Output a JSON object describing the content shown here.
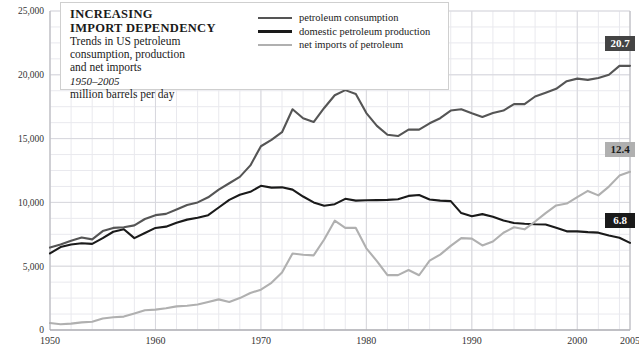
{
  "title": {
    "line1": "INCREASING",
    "line2": "IMPORT DEPENDENCY",
    "sub1": "Trends in US petroleum",
    "sub2": "consumption, production",
    "sub3": "and net imports",
    "period": "1950–2005",
    "units": "million barrels per day"
  },
  "legend": [
    {
      "label": "petroleum consumption",
      "color": "#555555"
    },
    {
      "label": "domestic petroleum production",
      "color": "#1a1a1a"
    },
    {
      "label": "net imports of petroleum",
      "color": "#b0b0b0"
    }
  ],
  "end_labels": [
    {
      "value": "20.7",
      "bg": "#444444",
      "fg": "#ffffff"
    },
    {
      "value": "12.4",
      "bg": "#b0b0b0",
      "fg": "#1a1a1a"
    },
    {
      "value": "6.8",
      "bg": "#1a1a1a",
      "fg": "#ffffff"
    }
  ],
  "axes": {
    "y_ticks": [
      "0",
      "5,000",
      "10,000",
      "15,000",
      "20,000",
      "25,000"
    ],
    "x_ticks": [
      "1950",
      "1960",
      "1970",
      "1980",
      "1990",
      "2000",
      "2005"
    ],
    "grid_color": "#d8d8dd",
    "axis_color": "#b8b8bd"
  },
  "chart_data": {
    "type": "line",
    "title": "INCREASING IMPORT DEPENDENCY",
    "subtitle": "Trends in US petroleum consumption, production and net imports, 1950–2005",
    "xlabel": "",
    "ylabel": "million barrels per day (thousands)",
    "xlim": [
      1950,
      2005
    ],
    "ylim": [
      0,
      25000
    ],
    "y_ticks": [
      0,
      5000,
      10000,
      15000,
      20000,
      25000
    ],
    "x_ticks": [
      1950,
      1960,
      1970,
      1980,
      1990,
      2000,
      2005
    ],
    "y_minor_step": 1250,
    "x_minor_step": 2,
    "grid": true,
    "legend_position": "top-right",
    "annotations": [
      {
        "text": "20.7",
        "series": "petroleum consumption",
        "x": 2005
      },
      {
        "text": "12.4",
        "series": "net imports of petroleum",
        "x": 2005
      },
      {
        "text": "6.8",
        "series": "domestic petroleum production",
        "x": 2005
      }
    ],
    "x": [
      1950,
      1951,
      1952,
      1953,
      1954,
      1955,
      1956,
      1957,
      1958,
      1959,
      1960,
      1961,
      1962,
      1963,
      1964,
      1965,
      1966,
      1967,
      1968,
      1969,
      1970,
      1971,
      1972,
      1973,
      1974,
      1975,
      1976,
      1977,
      1978,
      1979,
      1980,
      1981,
      1982,
      1983,
      1984,
      1985,
      1986,
      1987,
      1988,
      1989,
      1990,
      1991,
      1992,
      1993,
      1994,
      1995,
      1996,
      1997,
      1998,
      1999,
      2000,
      2001,
      2002,
      2003,
      2004,
      2005
    ],
    "series": [
      {
        "name": "petroleum consumption",
        "color": "#555555",
        "values": [
          6458,
          6700,
          7000,
          7250,
          7100,
          7750,
          8000,
          8050,
          8200,
          8700,
          9000,
          9100,
          9450,
          9800,
          10000,
          10400,
          11000,
          11500,
          12000,
          12900,
          14400,
          14900,
          15500,
          17300,
          16600,
          16300,
          17400,
          18400,
          18800,
          18500,
          17000,
          16000,
          15300,
          15200,
          15700,
          15700,
          16200,
          16600,
          17200,
          17300,
          16980,
          16700,
          17000,
          17200,
          17700,
          17700,
          18300,
          18600,
          18900,
          19500,
          19700,
          19600,
          19750,
          20000,
          20700,
          20700
        ]
      },
      {
        "name": "domestic petroleum production",
        "color": "#1a1a1a",
        "values": [
          6000,
          6500,
          6700,
          6800,
          6750,
          7200,
          7700,
          7900,
          7200,
          7600,
          8000,
          8100,
          8400,
          8650,
          8800,
          9000,
          9600,
          10200,
          10600,
          10830,
          11300,
          11160,
          11180,
          11000,
          10460,
          10000,
          9740,
          9860,
          10280,
          10140,
          10170,
          10180,
          10200,
          10250,
          10510,
          10580,
          10230,
          10140,
          10100,
          9160,
          8910,
          9080,
          8870,
          8580,
          8390,
          8330,
          8290,
          8270,
          8010,
          7730,
          7730,
          7670,
          7630,
          7400,
          7230,
          6830
        ]
      },
      {
        "name": "net imports of petroleum",
        "color": "#b0b0b0",
        "values": [
          545,
          450,
          500,
          600,
          650,
          900,
          1000,
          1050,
          1300,
          1550,
          1600,
          1700,
          1850,
          1900,
          2000,
          2200,
          2400,
          2200,
          2500,
          2900,
          3160,
          3700,
          4500,
          6000,
          5900,
          5850,
          7090,
          8570,
          8000,
          8000,
          6400,
          5400,
          4300,
          4300,
          4700,
          4290,
          5440,
          5910,
          6590,
          7200,
          7160,
          6630,
          6940,
          7620,
          8050,
          7890,
          8500,
          9160,
          9760,
          9910,
          10420,
          10900,
          10550,
          11240,
          12100,
          12400
        ]
      }
    ]
  }
}
